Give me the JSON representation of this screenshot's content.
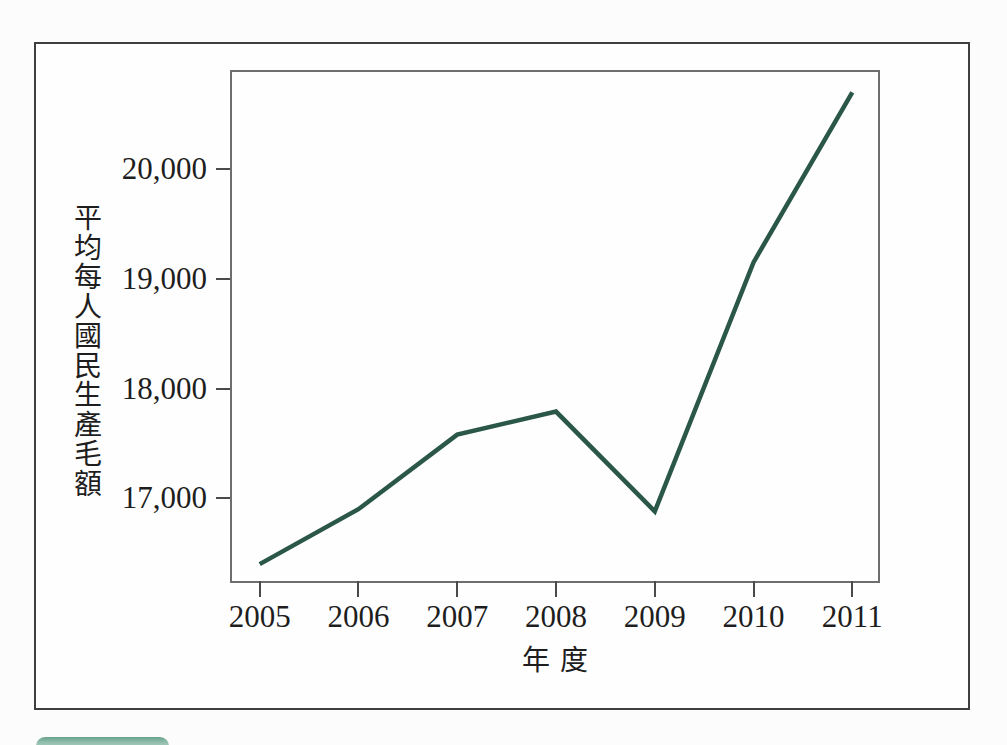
{
  "page": {
    "background": "#fcfcfc"
  },
  "figure_frame": {
    "border_color": "#3f3f3f",
    "background": "#fefefe"
  },
  "chart_data": {
    "type": "line",
    "title": "",
    "x": [
      2005,
      2006,
      2007,
      2008,
      2009,
      2010,
      2011
    ],
    "values": [
      16400,
      16900,
      17580,
      17790,
      16880,
      19150,
      20700
    ],
    "series": [
      {
        "name": "平均每人國民生產毛額",
        "values": [
          16400,
          16900,
          17580,
          17790,
          16880,
          19150,
          20700
        ]
      }
    ],
    "x_tick_labels": [
      "2005",
      "2006",
      "2007",
      "2008",
      "2009",
      "2010",
      "2011"
    ],
    "y_ticks": [
      17000,
      18000,
      19000,
      20000
    ],
    "y_tick_labels": [
      "17,000",
      "18,000",
      "19,000",
      "20,000"
    ],
    "xlabel": "年度",
    "ylabel": "平均每人國民生產毛額",
    "xlim": [
      2004.72,
      2011.26
    ],
    "ylim": [
      16246,
      20885
    ],
    "grid": false,
    "legend": "none",
    "line_color": "#2b5748",
    "axis_color": "#6e6e6e",
    "tick_color": "#4a4a4a",
    "text_color": "#1e1e1e"
  },
  "decor": {
    "bottom_tab_color": "#8fbcaa"
  }
}
